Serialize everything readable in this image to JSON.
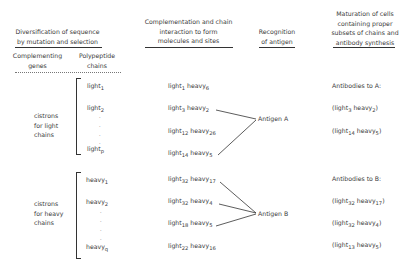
{
  "headers": {
    "col1": [
      "Diversification of sequence",
      "by mutation and selection"
    ],
    "col2": [
      "Complementation and chain",
      "interaction to form",
      "molecules and sites"
    ],
    "col3": [
      "Recognition",
      "of antigen"
    ],
    "col4": [
      "Maturation of cells",
      "containing proper",
      "subsets of chains and",
      "antibody synthesis"
    ]
  },
  "subheaders": {
    "genes": [
      "Complementing",
      "genes"
    ],
    "chains": [
      "Polypeptide",
      "chains"
    ]
  },
  "light_group": {
    "label": [
      "cistrons",
      "for light",
      "chains"
    ],
    "chains": [
      {
        "name": "light",
        "sub": "1"
      },
      {
        "name": "light",
        "sub": "2"
      },
      {
        "name": "light",
        "sub": "p"
      }
    ]
  },
  "heavy_group": {
    "label": [
      "cistrons",
      "for heavy",
      "chains"
    ],
    "chains": [
      {
        "name": "heavy",
        "sub": "1"
      },
      {
        "name": "heavy",
        "sub": "2"
      },
      {
        "name": "heavy",
        "sub": "q"
      }
    ]
  },
  "pairs_a": [
    {
      "l": "1",
      "h": "6"
    },
    {
      "l": "3",
      "h": "2"
    },
    {
      "l": "12",
      "h": "26"
    },
    {
      "l": "14",
      "h": "5"
    }
  ],
  "pairs_b": [
    {
      "l": "32",
      "h": "17"
    },
    {
      "l": "32",
      "h": "4"
    },
    {
      "l": "18",
      "h": "5"
    },
    {
      "l": "22",
      "h": "16"
    }
  ],
  "antigens": {
    "a": "Antigen A",
    "b": "Antigen B"
  },
  "antibodies_a": {
    "title": "Antibodies to A:",
    "items": [
      {
        "l": "3",
        "h": "2"
      },
      {
        "l": "14",
        "h": "5"
      }
    ]
  },
  "antibodies_b": {
    "title": "Antibodies to B:",
    "items": [
      {
        "l": "32",
        "h": "17"
      },
      {
        "l": "32",
        "h": "4"
      },
      {
        "l": "13",
        "h": "5"
      }
    ]
  },
  "words": {
    "light": "light",
    "heavy": "heavy",
    "open": "(",
    "close": ")",
    "dot": "."
  }
}
